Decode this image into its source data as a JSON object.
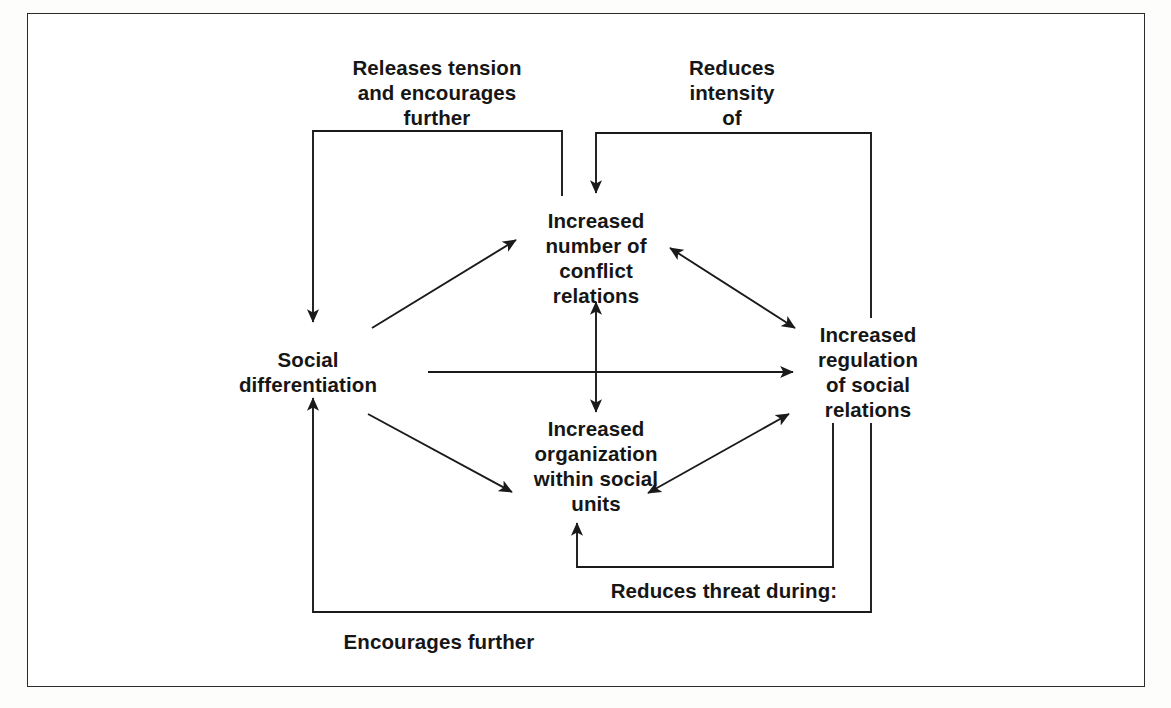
{
  "figure": {
    "background_color": "#ffffff",
    "line_color": "#1a1a1a",
    "text_color": "#161616",
    "frame": {
      "border_color": "#2b2b2b",
      "border_width_px": 1.6
    }
  },
  "nodes": [
    {
      "id": "social-differentiation",
      "label": "Social\ndifferentiation"
    },
    {
      "id": "conflict-relations",
      "label": "Increased\nnumber of\nconflict\nrelations"
    },
    {
      "id": "social-organization",
      "label": "Increased\norganization\nwithin social\nunits"
    },
    {
      "id": "social-regulation",
      "label": "Increased\nregulation\nof social\nrelations"
    }
  ],
  "edge_labels": [
    {
      "id": "releases-tension",
      "label": "Releases tension\nand encourages\nfurther"
    },
    {
      "id": "reduces-intensity",
      "label": "Reduces\nintensity\nof"
    },
    {
      "id": "reduces-threat",
      "label": "Reduces threat during:"
    },
    {
      "id": "encourages-further",
      "label": "Encourages further"
    }
  ]
}
